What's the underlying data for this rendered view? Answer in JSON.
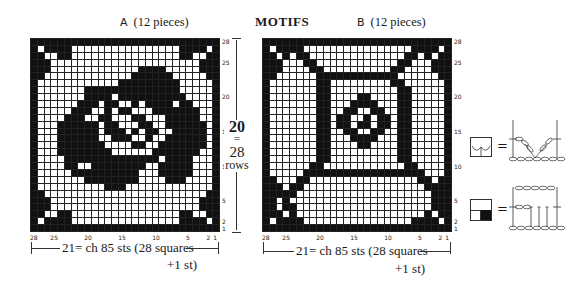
{
  "title": "MOTIFS",
  "motif_a": {
    "letter": "A",
    "label": "(12 pieces)",
    "width_dim": "21= ch 85 sts (28 squares",
    "width_dim2": "+1 st)",
    "height_dim": {
      "cm": "20",
      "eq": "=",
      "rows": "28",
      "unit": "rows"
    },
    "row_labels": [
      "28",
      "25",
      "20",
      "15",
      "10",
      "5",
      "2",
      "1"
    ],
    "col_labels": [
      "28",
      "25",
      "20",
      "15",
      "10",
      "5",
      "2",
      "1"
    ],
    "pattern": [
      "1111111111111111111111111111",
      "1011110000000000000000111101",
      "1100110000000000000000110011",
      "1110000000000000000000000111",
      "1110000000000000111100000111",
      "1100000000000001111110000011",
      "1000000000000111111111000001",
      "1000000011111111111111000001",
      "1000000011110111111111100001",
      "1000000111011001011110110001",
      "1000001110010110001111111001",
      "1000011100110001100011111001",
      "1000111111011000110011111101",
      "1000111111011101011001111101",
      "1000111111001110010011111101",
      "1000111111100001100111111101",
      "1000111111110000001111111001",
      "1000011111111111111011110001",
      "1000011001111111100111110001",
      "1000001111111111000111110001",
      "1000000011111111000011100001",
      "1000000000011100000000000001",
      "1100000000000000000000000011",
      "1110000000000000000000000111",
      "1110000000000000000000000111",
      "1100110000000000000000110011",
      "1011110000000000000000111101",
      "1111111111111111111111111111"
    ]
  },
  "motif_b": {
    "letter": "B",
    "label": "(12 pieces)",
    "width_dim": "21= ch 85 sts (28 squares",
    "width_dim2": "+1 st)",
    "row_labels": [
      "28",
      "25",
      "20",
      "15",
      "10",
      "5",
      "2",
      "1"
    ],
    "col_labels": [
      "28",
      "25",
      "20",
      "15",
      "10",
      "5",
      "2",
      "1"
    ],
    "pattern": [
      "1111111111111111111111111111",
      "1011110000000000000000111101",
      "1101011000000000000001101011",
      "1110001100000000000011000111",
      "1110000110000000000110000111",
      "1100000011111111111100000011",
      "1000000011000000000110000001",
      "1000000011000000000011000001",
      "1000000011000011000011000001",
      "1000000011000111100011000001",
      "1000000011001100110011000001",
      "1000000011011001011011000001",
      "1000000011011011011011000001",
      "1000000011001100110011000001",
      "1000000011000111100011000001",
      "1000000011000011000011000001",
      "1000000011000000000011000001",
      "1000000011000000000011000001",
      "1000000110000000000001100001",
      "1000001111111111111111110001",
      "1100011000000000000000011011",
      "1110110000000000000000001111",
      "1111100000000000000000000111",
      "1101000000000000000000000111",
      "1101100000000000000000000111",
      "1110100000000000000000001011",
      "1011110000000000000000111101",
      "1111111111111111111111111111"
    ]
  },
  "legend": [
    {
      "symbol": "open-mesh-with-v-stitch",
      "equals": "="
    },
    {
      "symbol": "filled-block-square",
      "equals": "="
    }
  ]
}
